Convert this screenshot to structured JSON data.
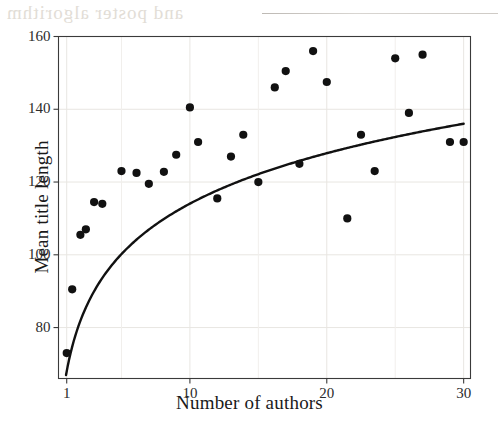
{
  "figure": {
    "type": "scatter-with-fit",
    "background": "#ffffff",
    "ink_color": "#111111",
    "grid_color": "#e8e6e2",
    "frame_color": "#3a3a3a"
  },
  "axes": {
    "x_title": "Number of authors",
    "y_title": "Mean title length",
    "x_ticks": [
      "1",
      "10",
      "20",
      "30"
    ],
    "y_ticks": [
      "160",
      "140",
      "120",
      "100",
      "80"
    ]
  },
  "artifacts": {
    "bleed_text": "and poster algorithm",
    "scan_line_name": "scan-streak"
  },
  "chart_data": {
    "type": "scatter",
    "title": "",
    "xlabel": "Number of authors",
    "ylabel": "Mean title length",
    "xlim": [
      0.4,
      30.5
    ],
    "ylim": [
      66,
      160
    ],
    "x_ticks": [
      1,
      10,
      20,
      30
    ],
    "y_ticks": [
      80,
      100,
      120,
      140,
      160
    ],
    "grid": true,
    "legend": false,
    "marker": "filled-circle",
    "marker_color": "#111111",
    "points": [
      {
        "x": 1,
        "y": 73
      },
      {
        "x": 1.4,
        "y": 90.5
      },
      {
        "x": 2,
        "y": 105.5
      },
      {
        "x": 2.4,
        "y": 107
      },
      {
        "x": 3,
        "y": 114.5
      },
      {
        "x": 3.6,
        "y": 114
      },
      {
        "x": 5,
        "y": 123
      },
      {
        "x": 6.1,
        "y": 122.5
      },
      {
        "x": 7,
        "y": 119.5
      },
      {
        "x": 8.1,
        "y": 122.8
      },
      {
        "x": 9,
        "y": 127.5
      },
      {
        "x": 10,
        "y": 140.5
      },
      {
        "x": 10.6,
        "y": 131
      },
      {
        "x": 12,
        "y": 115.5
      },
      {
        "x": 13,
        "y": 127
      },
      {
        "x": 13.9,
        "y": 133
      },
      {
        "x": 15,
        "y": 120
      },
      {
        "x": 16.2,
        "y": 146
      },
      {
        "x": 17,
        "y": 150.5
      },
      {
        "x": 18,
        "y": 125
      },
      {
        "x": 19,
        "y": 156
      },
      {
        "x": 20,
        "y": 147.5
      },
      {
        "x": 21.5,
        "y": 110
      },
      {
        "x": 22.5,
        "y": 133
      },
      {
        "x": 23.5,
        "y": 123
      },
      {
        "x": 25,
        "y": 154
      },
      {
        "x": 26,
        "y": 139
      },
      {
        "x": 27,
        "y": 155
      },
      {
        "x": 29,
        "y": 131
      },
      {
        "x": 30,
        "y": 131
      }
    ],
    "fit_curve": {
      "name": "logarithmic-fit",
      "description": "y = a + b*ln(x)",
      "a": 68,
      "b": 20.0,
      "color": "#111111",
      "width": 2.4,
      "x_range": [
        0.95,
        30
      ]
    }
  }
}
